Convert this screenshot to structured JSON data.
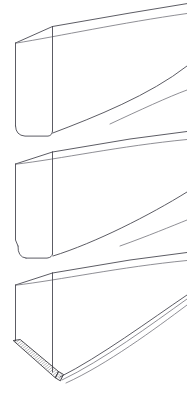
{
  "figure": {
    "background_color": "#ffffff",
    "line_color": "#4a4a52",
    "thin_line_color": "#6a6a72",
    "hatch_color": "#3a3a40",
    "canvas": {
      "width": 187,
      "height": 397
    },
    "view": "isometric line drawing, no text labels",
    "blocks": [
      {
        "id": "block-top",
        "label": "Top slab",
        "has_hatching": false,
        "rounded_bottom_corners": true,
        "open_right_end": true,
        "front_face": "M 15.5,43 L 52.5,26.5 L 52.5,131 L 20,136 L 15.5,126 Z",
        "top_face": "M 15.5,43 L 52.5,26.5 L 187,3 L 187,18 Z",
        "side_face": "M 52.5,26.5 L 187,3 L 187,30 L 52.5,131 Z",
        "edges": [
          "M 15.5,43 L 52.5,26.5",
          "M 52.5,26.5 L 187,3",
          "M 15.5,43 L 15.5,126",
          "M 52.5,26.5 L 52.5,131",
          "M 15.5,126 Q 15.9,135.6 25,136 L 50,136",
          "M 50,136 Q 52.3,135.5 52.5,131",
          "M 52.5,131 L 187,29",
          "M 52.5,131 L 55,132",
          "M 60,18 L 187,3",
          "M 63,22 L 187,10"
        ],
        "accent_lines": [
          "M 57,135 L 187,66",
          "M 110,124 L 187,90"
        ]
      },
      {
        "id": "block-middle",
        "label": "Middle slab",
        "has_hatching": false,
        "rounded_bottom_corners": true,
        "open_right_end": true,
        "front_face": "M 15.5,164 L 52.5,152 L 52.5,254 L 22,258 L 15.5,248 Z",
        "top_face": "M 15.5,164 L 52.5,152 L 187,132 L 187,144 Z",
        "edges": [
          "M 15.5,164 L 52.5,152",
          "M 52.5,152 L 187,132",
          "M 15.5,164 L 15.5,240",
          "M 15.5,240 L 18,246",
          "M 18,246 Q 17.6,257 26,258",
          "M 26,258 L 49,258",
          "M 49,258 Q 52.2,257.3 52.5,254",
          "M 52.5,152 L 52.5,254",
          "M 52.5,254 L 187,193",
          "M 52.5,254 L 56,256",
          "M 62,147 L 187,132",
          "M 60,151 L 187,139"
        ],
        "accent_lines": [
          "M 56,257 L 187,192",
          "M 120,245 L 187,220"
        ]
      },
      {
        "id": "block-bottom",
        "label": "Bottom slab with hatched edge",
        "has_hatching": true,
        "rounded_bottom_corners": true,
        "open_right_end": true,
        "hatch_description": "fine diagonal cross-hatched band along lower-left edge",
        "front_face": "M 15.5,285 L 52.5,273 L 52.5,374 L 20,350 L 15.5,340 Z",
        "top_face": "M 15.5,285 L 52.5,273 L 187,253 L 187,264 Z",
        "edges": [
          "M 15.5,285 L 52.5,273",
          "M 52.5,273 L 187,253",
          "M 15.5,285 L 15.5,340",
          "M 52.5,273 L 52.5,374",
          "M 52.5,374 L 187,297",
          "M 62,268 L 187,253"
        ],
        "hatch_band_left": "M 13.5,342 L 19.5,341 L 57,371 L 53,376 Z",
        "hatch_band_bottom": "M 53,376 L 57,371 L 62,374 L 58,379 Z",
        "accent_lines": [
          "M 57,376 L 187,295",
          "M 60,378 L 187,300",
          "M 66,381 L 187,306"
        ]
      }
    ]
  }
}
